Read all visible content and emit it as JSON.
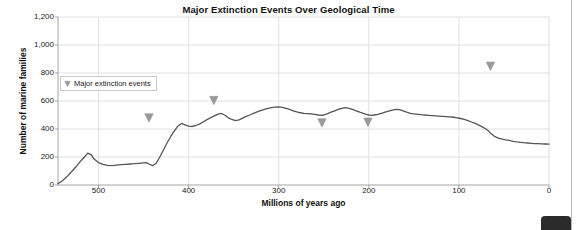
{
  "chart_data": {
    "type": "line",
    "title": "Major Extinction Events Over Geological Time",
    "xlabel": "Millions of years ago",
    "ylabel": "Number of marine families",
    "xlim": [
      545,
      0
    ],
    "ylim": [
      0,
      1200
    ],
    "x_reversed": true,
    "grid": true,
    "legend_position": "upper-left-inside",
    "yticks": [
      0,
      200,
      400,
      600,
      800,
      1000,
      1200
    ],
    "ytick_labels": [
      "0",
      "200",
      "400",
      "600",
      "800",
      "1,000",
      "1,200"
    ],
    "xticks": [
      500,
      400,
      300,
      200,
      100,
      0
    ],
    "xtick_labels": [
      "500",
      "400",
      "300",
      "200",
      "100",
      "0"
    ],
    "series": [
      {
        "name": "Number of marine families",
        "color": "#555555",
        "x": [
          545,
          540,
          535,
          530,
          525,
          520,
          515,
          512,
          508,
          505,
          500,
          495,
          490,
          485,
          480,
          475,
          470,
          465,
          460,
          455,
          450,
          447,
          444,
          440,
          436,
          432,
          428,
          424,
          420,
          416,
          412,
          408,
          404,
          400,
          396,
          392,
          388,
          384,
          380,
          376,
          372,
          368,
          364,
          360,
          356,
          352,
          348,
          344,
          340,
          336,
          332,
          328,
          324,
          320,
          316,
          312,
          308,
          304,
          300,
          296,
          292,
          288,
          284,
          280,
          276,
          272,
          268,
          264,
          260,
          256,
          252,
          250,
          248,
          245,
          242,
          238,
          234,
          230,
          226,
          222,
          218,
          214,
          210,
          206,
          203,
          200,
          197,
          194,
          190,
          186,
          182,
          178,
          174,
          170,
          166,
          162,
          158,
          154,
          150,
          146,
          142,
          138,
          134,
          130,
          126,
          122,
          118,
          114,
          110,
          106,
          102,
          98,
          94,
          90,
          86,
          82,
          78,
          74,
          70,
          67,
          65,
          63,
          60,
          56,
          52,
          48,
          44,
          40,
          36,
          32,
          28,
          24,
          20,
          16,
          12,
          8,
          4,
          0
        ],
        "y": [
          10,
          30,
          60,
          95,
          130,
          170,
          205,
          228,
          215,
          185,
          160,
          148,
          140,
          138,
          142,
          145,
          148,
          150,
          152,
          155,
          158,
          160,
          150,
          138,
          155,
          200,
          250,
          300,
          345,
          385,
          420,
          440,
          430,
          420,
          418,
          425,
          435,
          450,
          465,
          480,
          492,
          505,
          512,
          500,
          480,
          468,
          460,
          465,
          478,
          490,
          500,
          512,
          522,
          532,
          540,
          548,
          552,
          556,
          558,
          555,
          548,
          540,
          530,
          522,
          516,
          512,
          510,
          508,
          505,
          500,
          498,
          500,
          505,
          512,
          520,
          530,
          540,
          548,
          552,
          548,
          540,
          530,
          520,
          512,
          505,
          500,
          498,
          500,
          505,
          512,
          520,
          528,
          535,
          540,
          538,
          530,
          520,
          512,
          508,
          505,
          502,
          500,
          498,
          496,
          494,
          492,
          490,
          488,
          486,
          484,
          480,
          475,
          468,
          460,
          450,
          440,
          428,
          415,
          400,
          385,
          370,
          360,
          345,
          335,
          328,
          322,
          318,
          312,
          308,
          305,
          302,
          300,
          298,
          296,
          295,
          294,
          293,
          292
        ],
        "note": "Approximate Sepkoski-style marine family diversity curve; values read off gridlines"
      }
    ],
    "extinction_events": [
      {
        "label": "End-Ordovician",
        "x": 444,
        "y": 430
      },
      {
        "label": "Late Devonian",
        "x": 372,
        "y": 555
      },
      {
        "label": "End-Permian",
        "x": 252,
        "y": 395
      },
      {
        "label": "End-Triassic",
        "x": 201,
        "y": 400
      },
      {
        "label": "End-Cretaceous",
        "x": 65,
        "y": 800
      }
    ],
    "legend": [
      {
        "label": "Major extinction events",
        "marker": "triangle-down-icon",
        "color": "#9a9a9a"
      }
    ]
  }
}
